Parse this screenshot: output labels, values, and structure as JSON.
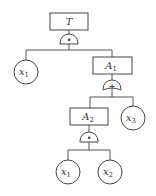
{
  "diagram": {
    "type": "fault-tree",
    "top_event": {
      "label": "T",
      "gate": "AND",
      "gate_symbol": "•"
    },
    "events": [
      {
        "id": "T",
        "label": "T",
        "sub": ""
      },
      {
        "id": "A1",
        "label": "A",
        "sub": "1"
      },
      {
        "id": "A2",
        "label": "A",
        "sub": "2"
      }
    ],
    "gates": [
      {
        "under": "T",
        "type": "AND",
        "symbol": "•"
      },
      {
        "under": "A1",
        "type": "OR",
        "symbol": "+"
      },
      {
        "under": "A2",
        "type": "AND",
        "symbol": "•"
      }
    ],
    "basic_events": [
      {
        "id": "x1_top",
        "label": "x",
        "sub": "1"
      },
      {
        "id": "x3",
        "label": "x",
        "sub": "3"
      },
      {
        "id": "x1_bottom",
        "label": "x",
        "sub": "1"
      },
      {
        "id": "x2",
        "label": "x",
        "sub": "2"
      }
    ]
  }
}
